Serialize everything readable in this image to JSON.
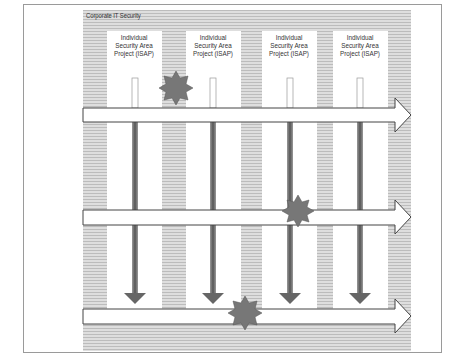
{
  "diagram": {
    "title": "Corporate IT Security",
    "columns": [
      {
        "label_line1": "Individual",
        "label_line2": "Security Area",
        "label_line3": "Project (ISAP)"
      },
      {
        "label_line1": "Individual",
        "label_line2": "Security Area",
        "label_line3": "Project (ISAP)"
      },
      {
        "label_line1": "Individual",
        "label_line2": "Security Area",
        "label_line3": "Project (ISAP)"
      },
      {
        "label_line1": "Individual",
        "label_line2": "Security Area",
        "label_line3": "Project (ISAP)"
      }
    ],
    "horizontal_arrows": 3,
    "down_arrows": 4,
    "stars": 3,
    "colors": {
      "background_hatch": "#d4d4d4",
      "column_fill": "#ffffff",
      "arrow_outline": "#444444",
      "down_arrow": "#666666",
      "star": "#777777",
      "frame": "#9a9a9a"
    }
  }
}
